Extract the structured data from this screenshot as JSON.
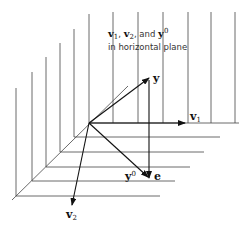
{
  "caption": {
    "line1_parts": [
      "v",
      "1",
      ", ",
      "v",
      "2",
      ", and ",
      "y",
      "0"
    ],
    "line2": "in horizontal plane"
  },
  "labels": {
    "y": "y",
    "v1": "v",
    "v1_sub": "1",
    "v2": "v",
    "v2_sub": "2",
    "y0": "y",
    "y0_sup": "0",
    "e": "e"
  },
  "geometry": {
    "origin": [
      89,
      123
    ],
    "y_tip": [
      149,
      78
    ],
    "y0_point": [
      149,
      178
    ],
    "v1_tip": [
      185,
      123
    ],
    "v2_tip": [
      72,
      205
    ]
  }
}
